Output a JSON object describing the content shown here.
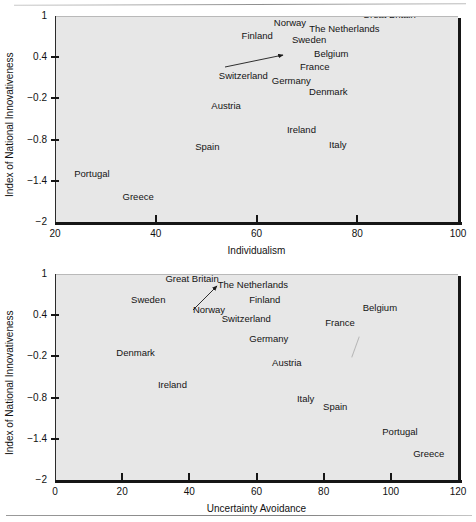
{
  "figure_top": {
    "axis": {
      "ylabel": "Index of National Innovativeness",
      "xlabel": "Individualism",
      "yticks": [
        "1",
        "0.4",
        "−0.2",
        "−0.8",
        "−1.4",
        "−2"
      ],
      "xticks": [
        "20",
        "40",
        "60",
        "80",
        "100"
      ]
    }
  },
  "figure_bottom": {
    "axis": {
      "ylabel": "Index of National Innovativeness",
      "xlabel": "Uncertainty Avoidance",
      "yticks": [
        "1",
        "0.4",
        "−0.2",
        "−0.8",
        "−1.4",
        "−2"
      ],
      "xticks": [
        "0",
        "20",
        "40",
        "60",
        "80",
        "100",
        "120"
      ]
    }
  },
  "chart_data": [
    {
      "type": "scatter",
      "id": "innovativeness-vs-individualism",
      "title": "",
      "xlabel": "Individualism",
      "ylabel": "Index of National Innovativeness",
      "xlim": [
        20,
        100
      ],
      "ylim": [
        -2,
        1
      ],
      "xticks": [
        20,
        40,
        60,
        80,
        100
      ],
      "yticks": [
        1,
        0.4,
        -0.2,
        -0.8,
        -1.4,
        -2
      ],
      "grid": false,
      "legend": "none",
      "markers": "labels-only",
      "annotations": [
        {
          "label": "Switzerland",
          "x": 68,
          "y": 0.4,
          "note": "label offset left, arrow points to point"
        }
      ],
      "points": [
        {
          "label": "Great Britain",
          "x": 89,
          "y": 0.92
        },
        {
          "label": "Norway",
          "x": 69,
          "y": 0.85
        },
        {
          "label": "The Netherlands",
          "x": 80,
          "y": 0.82
        },
        {
          "label": "Finland",
          "x": 63,
          "y": 0.75
        },
        {
          "label": "Sweden",
          "x": 71,
          "y": 0.72
        },
        {
          "label": "Belgium",
          "x": 75,
          "y": 0.58
        },
        {
          "label": "France",
          "x": 71,
          "y": 0.42
        },
        {
          "label": "Switzerland",
          "x": 68,
          "y": 0.4
        },
        {
          "label": "Germany",
          "x": 67,
          "y": 0.22
        },
        {
          "label": "Denmark",
          "x": 74,
          "y": 0.05
        },
        {
          "label": "Austria",
          "x": 55,
          "y": -0.21
        },
        {
          "label": "Ireland",
          "x": 70,
          "y": -0.62
        },
        {
          "label": "Italy",
          "x": 76,
          "y": -0.75
        },
        {
          "label": "Spain",
          "x": 51,
          "y": -0.83
        },
        {
          "label": "Portugal",
          "x": 27,
          "y": -1.29
        },
        {
          "label": "Greece",
          "x": 35,
          "y": -1.56
        }
      ]
    },
    {
      "type": "scatter",
      "id": "innovativeness-vs-uncertainty-avoidance",
      "title": "",
      "xlabel": "Uncertainty Avoidance",
      "ylabel": "Index of National Innovativeness",
      "xlim": [
        0,
        120
      ],
      "ylim": [
        -2,
        1
      ],
      "xticks": [
        0,
        20,
        40,
        60,
        80,
        100,
        120
      ],
      "yticks": [
        1,
        0.4,
        -0.2,
        -0.8,
        -1.4,
        -2
      ],
      "grid": false,
      "legend": "none",
      "markers": "labels-only",
      "annotations": [
        {
          "label": "Norway",
          "x": 50,
          "y": 0.82,
          "note": "label offset below, arrow points up-right to point"
        }
      ],
      "points": [
        {
          "label": "Great Britain",
          "x": 43,
          "y": 0.86
        },
        {
          "label": "The Netherlands",
          "x": 58,
          "y": 0.82
        },
        {
          "label": "Norway",
          "x": 50,
          "y": 0.72
        },
        {
          "label": "Finland",
          "x": 62,
          "y": 0.7
        },
        {
          "label": "Sweden",
          "x": 31,
          "y": 0.7
        },
        {
          "label": "Belgium",
          "x": 97,
          "y": 0.52
        },
        {
          "label": "Switzerland",
          "x": 58,
          "y": 0.47
        },
        {
          "label": "France",
          "x": 87,
          "y": 0.42
        },
        {
          "label": "Germany",
          "x": 65,
          "y": 0.1
        },
        {
          "label": "Denmark",
          "x": 26,
          "y": -0.11
        },
        {
          "label": "Austria",
          "x": 70,
          "y": -0.25
        },
        {
          "label": "Ireland",
          "x": 36,
          "y": -0.58
        },
        {
          "label": "Italy",
          "x": 75,
          "y": -0.78
        },
        {
          "label": "Spain",
          "x": 84,
          "y": -0.83
        },
        {
          "label": "Portugal",
          "x": 104,
          "y": -1.26
        },
        {
          "label": "Greece",
          "x": 112,
          "y": -1.55
        }
      ]
    }
  ]
}
